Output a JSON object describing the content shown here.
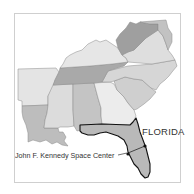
{
  "map": {
    "title": "Southeastern United States",
    "highlight_state": "Florida",
    "labels": {
      "florida": "FLORIDA",
      "ksc": "John F. Kennedy Space Center"
    },
    "states": [
      {
        "name": "Arkansas",
        "fill": "#e4e4e4"
      },
      {
        "name": "Louisiana",
        "fill": "#bdbdbd"
      },
      {
        "name": "Mississippi",
        "fill": "#dcdcdc"
      },
      {
        "name": "Alabama",
        "fill": "#c4c4c4"
      },
      {
        "name": "Georgia",
        "fill": "#ececec"
      },
      {
        "name": "Florida",
        "fill": "#b9b9b9"
      },
      {
        "name": "South Carolina",
        "fill": "#cfcfcf"
      },
      {
        "name": "North Carolina",
        "fill": "#d6d6d6"
      },
      {
        "name": "Tennessee",
        "fill": "#a9a9a9"
      },
      {
        "name": "Kentucky",
        "fill": "#e6e6e6"
      },
      {
        "name": "Virginia",
        "fill": "#dedede"
      },
      {
        "name": "West Virginia",
        "fill": "#9f9f9f"
      },
      {
        "name": "Maryland/Delaware",
        "fill": "#c2c2c2"
      }
    ],
    "colors": {
      "frame": "#cfcfcf",
      "state_border": "#8a8a8a",
      "highlight_border": "#111111"
    }
  }
}
